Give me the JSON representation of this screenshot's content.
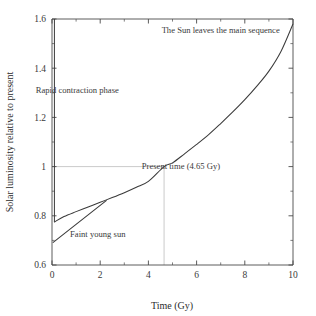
{
  "chart_data": {
    "type": "line",
    "title": "",
    "xlabel": "Time (Gy)",
    "ylabel": "Solar luminosity relative to present",
    "xlim": [
      0,
      10
    ],
    "ylim": [
      0.6,
      1.6
    ],
    "xticks": [
      "0",
      "2",
      "4",
      "6",
      "8",
      "10"
    ],
    "xtick_values": [
      0,
      2,
      4,
      6,
      8,
      10
    ],
    "xminor_values": [
      1,
      3,
      5,
      7,
      9
    ],
    "yticks": [
      "0.6",
      "0.8",
      "1",
      "1.2",
      "1.4",
      "1.6"
    ],
    "ytick_values": [
      0.6,
      0.8,
      1.0,
      1.2,
      1.4,
      1.6
    ],
    "yminor_values": [
      0.7,
      0.9,
      1.1,
      1.3,
      1.5
    ],
    "grid": false,
    "legend": "none",
    "series": [
      {
        "name": "Solar luminosity evolution",
        "x": [
          0.1,
          0.5,
          1.0,
          1.5,
          2.0,
          2.5,
          3.0,
          3.5,
          4.0,
          4.65,
          5.0,
          5.5,
          6.0,
          6.5,
          7.0,
          7.5,
          8.0,
          8.5,
          9.0,
          9.5,
          10.0
        ],
        "y": [
          0.775,
          0.797,
          0.817,
          0.836,
          0.855,
          0.874,
          0.894,
          0.916,
          0.94,
          1.0,
          1.015,
          1.052,
          1.09,
          1.13,
          1.175,
          1.222,
          1.272,
          1.327,
          1.388,
          1.468,
          1.58
        ]
      },
      {
        "name": "Faint young sun (linear extrapolation)",
        "x": [
          0.05,
          2.25
        ],
        "y": [
          0.692,
          0.862
        ]
      },
      {
        "name": "Rapid contraction phase (vertical drop)",
        "x": [
          0.1,
          0.1
        ],
        "y": [
          1.6,
          0.775
        ]
      }
    ],
    "guides": [
      {
        "name": "present-luminosity-guide",
        "orientation": "horizontal",
        "value": 1.0,
        "from": 0.0,
        "to": 4.65
      },
      {
        "name": "present-time-guide",
        "orientation": "vertical",
        "value": 4.65,
        "from": 0.6,
        "to": 1.0
      }
    ],
    "annotations": [
      {
        "id": "main-sequence-exit",
        "text": "The Sun leaves the main sequence",
        "x": 7.0,
        "y": 1.545
      },
      {
        "id": "rapid-contraction",
        "text": "Rapid contraction phase",
        "x": 1.05,
        "y": 1.3
      },
      {
        "id": "present-time",
        "text": "Present time (4.65 Gy)",
        "x": 5.35,
        "y": 0.99
      },
      {
        "id": "faint-young-sun",
        "text": "Faint young sun",
        "x": 1.9,
        "y": 0.715
      }
    ],
    "colors": {
      "background": "#ffffff",
      "curve": "#3a3a3a",
      "axis": "#4a4a4a",
      "guide": "#b9b9b9",
      "text": "#2b2b2b"
    }
  }
}
